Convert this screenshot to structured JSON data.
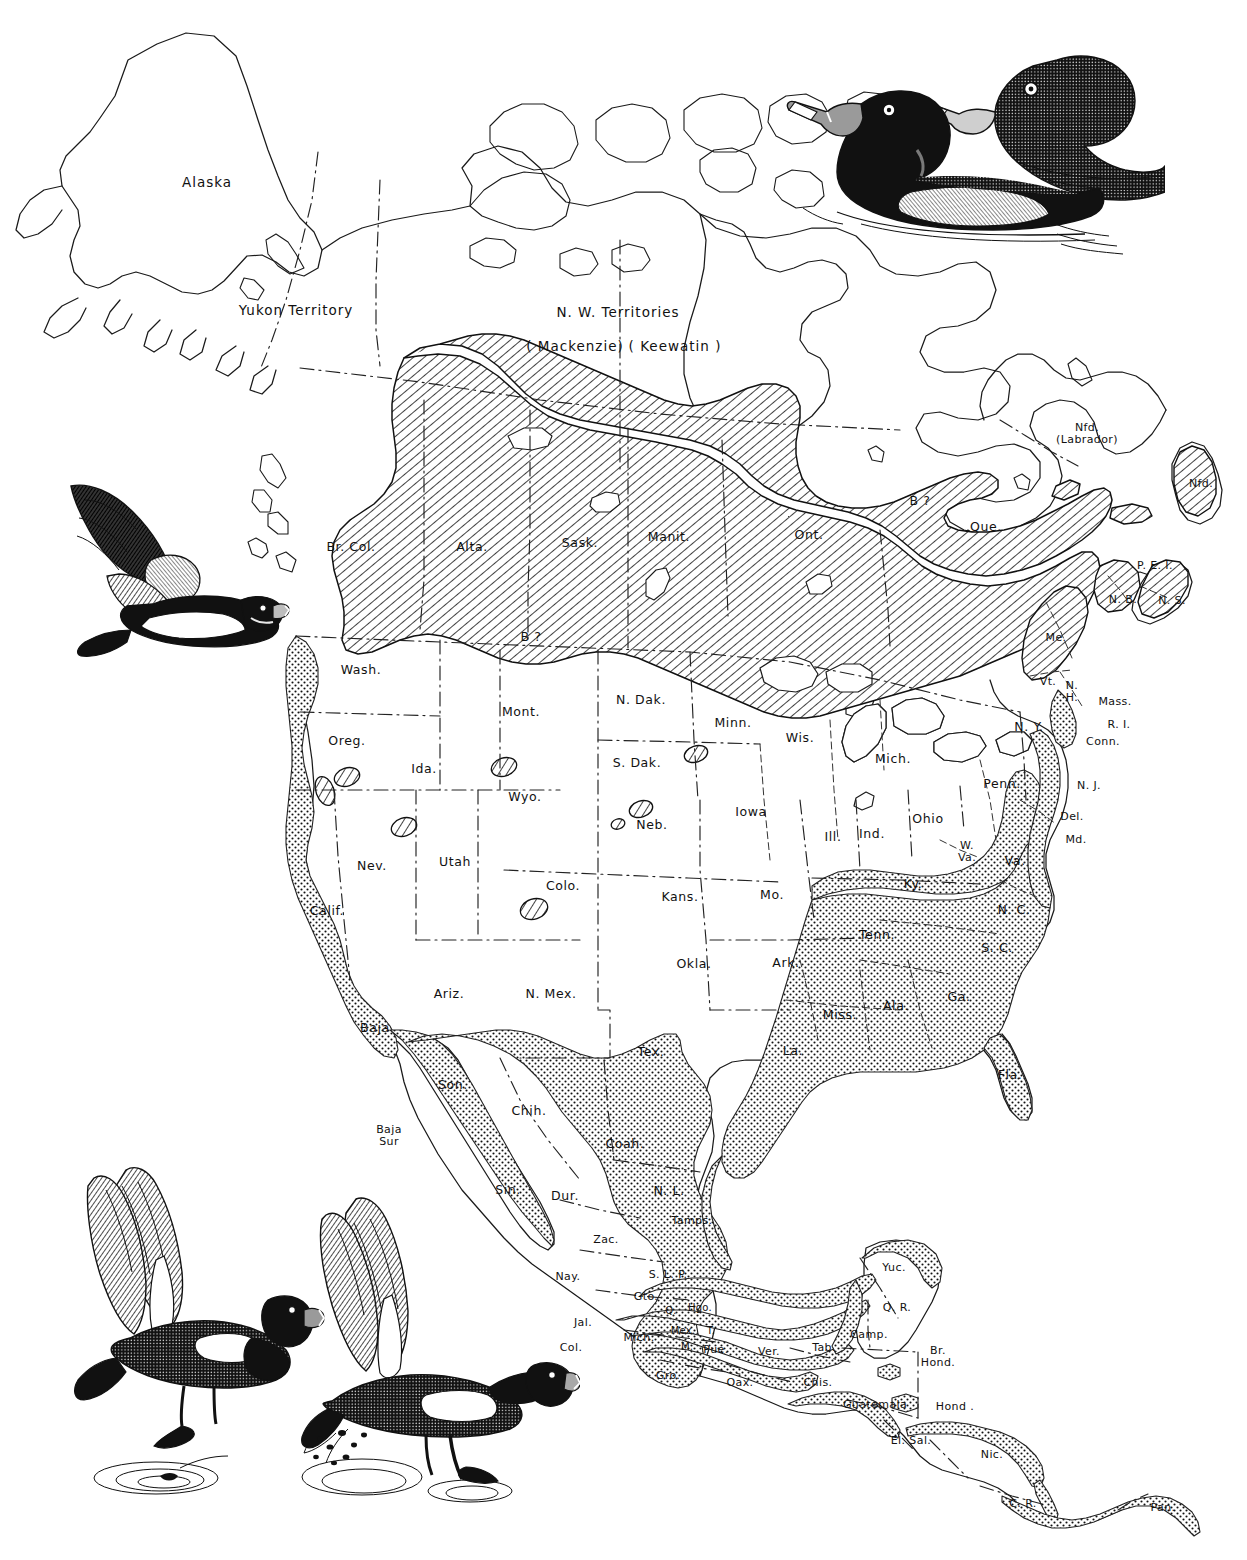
{
  "map": {
    "title": "Ring-necked Duck range map of North America",
    "species": "Ring-necked Duck",
    "legend": {
      "breeding_pattern": "diagonal-hatching",
      "wintering_pattern": "stipple-dots",
      "breeding_note": "B?",
      "breeding_color": "#000000",
      "wintering_color": "#000000",
      "outline_color": "#1a1a1a",
      "background_color": "#ffffff"
    },
    "labels": [
      {
        "id": "alaska",
        "text": "Alaska",
        "x": 207,
        "y": 183,
        "size": "lg"
      },
      {
        "id": "yukon-territory",
        "text": "Yukon Territory",
        "x": 296,
        "y": 311,
        "size": "lg"
      },
      {
        "id": "nw-territories",
        "text": "N. W. Territories",
        "x": 618,
        "y": 313,
        "size": "lg"
      },
      {
        "id": "mackenzie",
        "text": "( Mackenzie)",
        "x": 575,
        "y": 347,
        "size": "lg"
      },
      {
        "id": "keewatin",
        "text": "( Keewatin )",
        "x": 675,
        "y": 347,
        "size": "lg"
      },
      {
        "id": "br-col",
        "text": "Br. Col.",
        "x": 351,
        "y": 547,
        "size": ""
      },
      {
        "id": "alta",
        "text": "Alta.",
        "x": 472,
        "y": 547,
        "size": ""
      },
      {
        "id": "sask",
        "text": "Sask.",
        "x": 580,
        "y": 543,
        "size": ""
      },
      {
        "id": "manit",
        "text": "Manit.",
        "x": 669,
        "y": 537,
        "size": ""
      },
      {
        "id": "ont",
        "text": "Ont.",
        "x": 809,
        "y": 535,
        "size": ""
      },
      {
        "id": "que",
        "text": "Que.",
        "x": 986,
        "y": 527,
        "size": ""
      },
      {
        "id": "b-hudson",
        "text": "B ?",
        "x": 920,
        "y": 501,
        "size": ""
      },
      {
        "id": "nfd-labrador",
        "text": "Nfd.\n(Labrador)",
        "x": 1087,
        "y": 434,
        "size": "sm",
        "two": true
      },
      {
        "id": "nfd",
        "text": "Nfd.",
        "x": 1201,
        "y": 484,
        "size": "sm"
      },
      {
        "id": "pei",
        "text": "P. E. I.",
        "x": 1155,
        "y": 566,
        "size": "sm"
      },
      {
        "id": "nb",
        "text": "N. B.",
        "x": 1123,
        "y": 600,
        "size": "sm"
      },
      {
        "id": "ns",
        "text": "N. S.",
        "x": 1172,
        "y": 601,
        "size": "sm"
      },
      {
        "id": "me",
        "text": "Me.",
        "x": 1056,
        "y": 638,
        "size": "sm"
      },
      {
        "id": "b-prairie",
        "text": "B ?",
        "x": 531,
        "y": 637,
        "size": ""
      },
      {
        "id": "wash",
        "text": "Wash.",
        "x": 361,
        "y": 670,
        "size": ""
      },
      {
        "id": "mont",
        "text": "Mont.",
        "x": 521,
        "y": 712,
        "size": ""
      },
      {
        "id": "n-dak",
        "text": "N. Dak.",
        "x": 641,
        "y": 700,
        "size": ""
      },
      {
        "id": "minn",
        "text": "Minn.",
        "x": 733,
        "y": 723,
        "size": ""
      },
      {
        "id": "wis",
        "text": "Wis.",
        "x": 800,
        "y": 738,
        "size": ""
      },
      {
        "id": "mich",
        "text": "Mich.",
        "x": 893,
        "y": 759,
        "size": ""
      },
      {
        "id": "vt",
        "text": "Vt.",
        "x": 1048,
        "y": 682,
        "size": "sm"
      },
      {
        "id": "nh",
        "text": "N.\nH.",
        "x": 1072,
        "y": 692,
        "size": "sm",
        "two": true
      },
      {
        "id": "mass",
        "text": "Mass.",
        "x": 1115,
        "y": 702,
        "size": "sm"
      },
      {
        "id": "ri",
        "text": "R. I.",
        "x": 1119,
        "y": 725,
        "size": "sm"
      },
      {
        "id": "conn",
        "text": "Conn.",
        "x": 1103,
        "y": 742,
        "size": "sm"
      },
      {
        "id": "ny",
        "text": "N. Y.",
        "x": 1029,
        "y": 727,
        "size": ""
      },
      {
        "id": "oreg",
        "text": "Oreg.",
        "x": 347,
        "y": 741,
        "size": ""
      },
      {
        "id": "ida",
        "text": "Ida.",
        "x": 424,
        "y": 769,
        "size": ""
      },
      {
        "id": "s-dak",
        "text": "S. Dak.",
        "x": 637,
        "y": 763,
        "size": ""
      },
      {
        "id": "penn",
        "text": "Penn.",
        "x": 1002,
        "y": 784,
        "size": ""
      },
      {
        "id": "wyo",
        "text": "Wyo.",
        "x": 525,
        "y": 797,
        "size": ""
      },
      {
        "id": "iowa",
        "text": "Iowa",
        "x": 751,
        "y": 812,
        "size": ""
      },
      {
        "id": "neb",
        "text": "Neb.",
        "x": 652,
        "y": 825,
        "size": ""
      },
      {
        "id": "ill",
        "text": "Ill.",
        "x": 833,
        "y": 837,
        "size": ""
      },
      {
        "id": "ind",
        "text": "Ind.",
        "x": 872,
        "y": 834,
        "size": ""
      },
      {
        "id": "ohio",
        "text": "Ohio",
        "x": 928,
        "y": 819,
        "size": ""
      },
      {
        "id": "nj",
        "text": "N. J.",
        "x": 1089,
        "y": 786,
        "size": "sm"
      },
      {
        "id": "del",
        "text": "Del.",
        "x": 1072,
        "y": 817,
        "size": "sm"
      },
      {
        "id": "md",
        "text": "Md.",
        "x": 1076,
        "y": 840,
        "size": "sm"
      },
      {
        "id": "w-va",
        "text": "W.\nVa.",
        "x": 967,
        "y": 852,
        "size": "sm",
        "two": true
      },
      {
        "id": "va",
        "text": "Va.",
        "x": 1015,
        "y": 861,
        "size": ""
      },
      {
        "id": "nev",
        "text": "Nev.",
        "x": 372,
        "y": 866,
        "size": ""
      },
      {
        "id": "utah",
        "text": "Utah",
        "x": 455,
        "y": 862,
        "size": ""
      },
      {
        "id": "colo",
        "text": "Colo.",
        "x": 563,
        "y": 886,
        "size": ""
      },
      {
        "id": "kans",
        "text": "Kans.",
        "x": 680,
        "y": 897,
        "size": ""
      },
      {
        "id": "mo",
        "text": "Mo.",
        "x": 772,
        "y": 895,
        "size": ""
      },
      {
        "id": "ky",
        "text": "Ky.",
        "x": 913,
        "y": 884,
        "size": ""
      },
      {
        "id": "n-c",
        "text": "N. C.",
        "x": 1014,
        "y": 910,
        "size": ""
      },
      {
        "id": "calif",
        "text": "Calif.",
        "x": 327,
        "y": 911,
        "size": ""
      },
      {
        "id": "tenn",
        "text": "Tenn.",
        "x": 877,
        "y": 935,
        "size": ""
      },
      {
        "id": "s-c",
        "text": "S. C.",
        "x": 997,
        "y": 948,
        "size": ""
      },
      {
        "id": "okla",
        "text": "Okla.",
        "x": 694,
        "y": 964,
        "size": ""
      },
      {
        "id": "ark",
        "text": "Ark.",
        "x": 786,
        "y": 963,
        "size": ""
      },
      {
        "id": "ariz",
        "text": "Ariz.",
        "x": 449,
        "y": 994,
        "size": ""
      },
      {
        "id": "n-mex",
        "text": "N. Mex.",
        "x": 551,
        "y": 994,
        "size": ""
      },
      {
        "id": "miss",
        "text": "Miss.",
        "x": 840,
        "y": 1015,
        "size": ""
      },
      {
        "id": "ala",
        "text": "Ala.",
        "x": 896,
        "y": 1006,
        "size": ""
      },
      {
        "id": "ga",
        "text": "Ga.",
        "x": 959,
        "y": 997,
        "size": ""
      },
      {
        "id": "baja",
        "text": "Baja",
        "x": 375,
        "y": 1028,
        "size": ""
      },
      {
        "id": "la",
        "text": "La.",
        "x": 793,
        "y": 1051,
        "size": ""
      },
      {
        "id": "tex",
        "text": "Tex.",
        "x": 651,
        "y": 1052,
        "size": ""
      },
      {
        "id": "fla",
        "text": "Fla.",
        "x": 1010,
        "y": 1075,
        "size": ""
      },
      {
        "id": "son",
        "text": "Son.",
        "x": 453,
        "y": 1085,
        "size": ""
      },
      {
        "id": "chih",
        "text": "Chih.",
        "x": 529,
        "y": 1111,
        "size": ""
      },
      {
        "id": "baja-sur",
        "text": "Baja\nSur",
        "x": 389,
        "y": 1136,
        "size": "sm",
        "two": true
      },
      {
        "id": "coah",
        "text": "Coah.",
        "x": 625,
        "y": 1144,
        "size": ""
      },
      {
        "id": "n-l",
        "text": "N. L.",
        "x": 669,
        "y": 1191,
        "size": ""
      },
      {
        "id": "sin",
        "text": "Sin.",
        "x": 508,
        "y": 1190,
        "size": ""
      },
      {
        "id": "dur",
        "text": "Dur.",
        "x": 565,
        "y": 1196,
        "size": ""
      },
      {
        "id": "tamps",
        "text": "Tamps.",
        "x": 692,
        "y": 1221,
        "size": "sm"
      },
      {
        "id": "zac",
        "text": "Zac.",
        "x": 606,
        "y": 1240,
        "size": "sm"
      },
      {
        "id": "s-l-p",
        "text": "S. L. P.",
        "x": 668,
        "y": 1275,
        "size": "sm"
      },
      {
        "id": "nay",
        "text": "Nay.",
        "x": 568,
        "y": 1277,
        "size": "sm"
      },
      {
        "id": "gto",
        "text": "Gto.",
        "x": 646,
        "y": 1297,
        "size": "sm"
      },
      {
        "id": "q",
        "text": "Q.",
        "x": 671,
        "y": 1311,
        "size": "xs"
      },
      {
        "id": "hgo",
        "text": "Hgo.",
        "x": 700,
        "y": 1308,
        "size": "xs"
      },
      {
        "id": "jal",
        "text": "Jal.",
        "x": 583,
        "y": 1323,
        "size": "sm"
      },
      {
        "id": "mich-mx",
        "text": "Mich.",
        "x": 639,
        "y": 1338,
        "size": "sm"
      },
      {
        "id": "mex",
        "text": "Mex.",
        "x": 683,
        "y": 1331,
        "size": "xs"
      },
      {
        "id": "t",
        "text": "T.",
        "x": 711,
        "y": 1331,
        "size": "xs"
      },
      {
        "id": "m",
        "text": "M.",
        "x": 687,
        "y": 1347,
        "size": "xs"
      },
      {
        "id": "pue",
        "text": "Pue.",
        "x": 716,
        "y": 1350,
        "size": "sm"
      },
      {
        "id": "col",
        "text": "Col.",
        "x": 571,
        "y": 1348,
        "size": "sm"
      },
      {
        "id": "ver",
        "text": "Ver.",
        "x": 769,
        "y": 1352,
        "size": "sm"
      },
      {
        "id": "tab",
        "text": "Tab.",
        "x": 824,
        "y": 1348,
        "size": "sm"
      },
      {
        "id": "gro",
        "text": "Gro.",
        "x": 668,
        "y": 1376,
        "size": "sm"
      },
      {
        "id": "oax",
        "text": "Oax.",
        "x": 740,
        "y": 1383,
        "size": "sm"
      },
      {
        "id": "chis",
        "text": "Chis.",
        "x": 818,
        "y": 1383,
        "size": "sm"
      },
      {
        "id": "yuc",
        "text": "Yuc.",
        "x": 894,
        "y": 1268,
        "size": "sm"
      },
      {
        "id": "q-r",
        "text": "Q. R.",
        "x": 897,
        "y": 1308,
        "size": "sm"
      },
      {
        "id": "camp",
        "text": "Camp.",
        "x": 869,
        "y": 1335,
        "size": "sm"
      },
      {
        "id": "br-hond",
        "text": "Br.\nHond.",
        "x": 938,
        "y": 1357,
        "size": "sm",
        "two": true
      },
      {
        "id": "guatemala",
        "text": "Guatemala",
        "x": 875,
        "y": 1405,
        "size": "sm"
      },
      {
        "id": "hond",
        "text": "Hond .",
        "x": 955,
        "y": 1407,
        "size": "sm"
      },
      {
        "id": "el-sal",
        "text": "El. Sal.",
        "x": 911,
        "y": 1441,
        "size": "sm"
      },
      {
        "id": "nic",
        "text": "Nic.",
        "x": 992,
        "y": 1455,
        "size": "sm"
      },
      {
        "id": "c-r",
        "text": "C. R.",
        "x": 1023,
        "y": 1504,
        "size": "sm"
      },
      {
        "id": "pan",
        "text": "Pan.",
        "x": 1163,
        "y": 1508,
        "size": "sm"
      }
    ],
    "illustrations": [
      {
        "id": "swimming-pair",
        "name": "swimming-ducks-illustration",
        "x": 765,
        "y": 42,
        "w": 400,
        "h": 215,
        "caption": "Ring-necked Duck pair swimming (male foreground, female behind)"
      },
      {
        "id": "flying-duck",
        "name": "flying-duck-illustration",
        "x": 55,
        "y": 478,
        "w": 235,
        "h": 195,
        "caption": "Ring-necked Duck in flight"
      },
      {
        "id": "landing-duck",
        "name": "landing-duck-illustration",
        "x": 60,
        "y": 1160,
        "w": 265,
        "h": 360,
        "caption": "Ring-necked Duck landing on water"
      },
      {
        "id": "takeoff-duck",
        "name": "takeoff-duck-illustration",
        "x": 300,
        "y": 1195,
        "w": 280,
        "h": 330,
        "caption": "Ring-necked Duck taking off from water"
      }
    ]
  }
}
